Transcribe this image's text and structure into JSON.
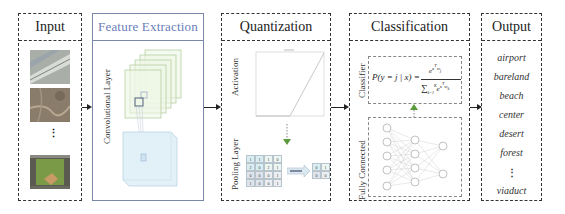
{
  "panels": {
    "input": {
      "title": "Input",
      "images": [
        "runway-aerial-image",
        "bareland-aerial-image",
        "baseball-field-aerial-image"
      ],
      "ellipsis": "⋮"
    },
    "feature_extraction": {
      "title": "Feature Extraction",
      "layer_label": "Convolutional Layer"
    },
    "quantization": {
      "title": "Quantization",
      "activation_label": "Activation",
      "pooling_label": "Pooling Layer",
      "pool_input": [
        [
          "1",
          "1",
          "1",
          "0"
        ],
        [
          "2",
          "0",
          "2",
          "1"
        ],
        [
          "0",
          "0",
          "0",
          "1"
        ],
        [
          "1",
          "0",
          "0",
          "1"
        ]
      ],
      "pool_output": [
        [
          "0",
          "1"
        ],
        [
          "0",
          "0"
        ]
      ],
      "pool_arrow_label": "max pooling"
    },
    "classification": {
      "title": "Classification",
      "classifier_label": "Classifier",
      "fc_label": "Fully Connected",
      "formula_lhs": "P(y = j | x) =",
      "formula_num": "e^{x^T w_j}",
      "formula_den": "∑_{k=1}^{K} e^{x^T w_k}"
    },
    "output": {
      "title": "Output",
      "classes": [
        "airport",
        "bareland",
        "beach",
        "center",
        "desert",
        "forest"
      ],
      "ellipsis": "⋮",
      "last_class": "viaduct"
    }
  },
  "colors": {
    "feature_border": "#7a87a8",
    "feature_title": "#6a7db8",
    "arrow_green": "#5a9a3a"
  }
}
